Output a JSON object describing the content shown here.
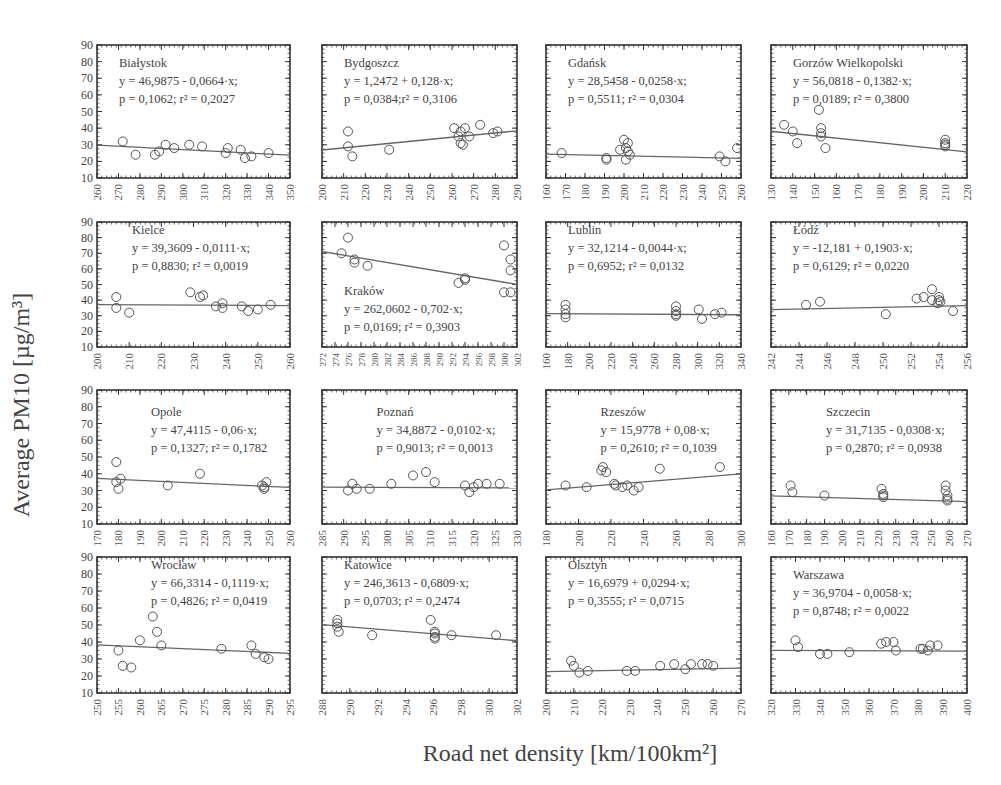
{
  "figure": {
    "y_axis_label": "Average PM10 [µg/m³]",
    "x_axis_label": "Road net density [km/100km²]"
  },
  "chart_data": [
    {
      "type": "scatter",
      "city": "Białystok",
      "equation": "y = 46,9875 - 0,0664·x;",
      "stats": "p = 0,1062; r² = 0,2027",
      "xlim": [
        260,
        350
      ],
      "xticks": [
        260,
        270,
        280,
        290,
        300,
        310,
        320,
        330,
        340,
        350
      ],
      "ylim": [
        10,
        90
      ],
      "yticks": [
        10,
        20,
        30,
        40,
        50,
        60,
        70,
        80,
        90
      ],
      "fit": {
        "intercept": 46.9875,
        "slope": -0.0664
      },
      "x": [
        272,
        278,
        287,
        289,
        292,
        296,
        303,
        309,
        320,
        321,
        327,
        329,
        332,
        340
      ],
      "y": [
        32,
        24,
        24,
        26,
        30,
        28,
        30,
        29,
        25,
        28,
        27,
        22,
        23,
        25
      ],
      "label_pos": "top-left"
    },
    {
      "type": "scatter",
      "city": "Bydgoszcz",
      "equation": "y = 1,2472 + 0,128·x;",
      "stats": "p = 0,0384;r² = 0,3106",
      "xlim": [
        200,
        290
      ],
      "xticks": [
        200,
        210,
        220,
        230,
        240,
        250,
        260,
        270,
        280,
        290
      ],
      "ylim": [
        10,
        90
      ],
      "yticks": [
        10,
        20,
        30,
        40,
        50,
        60,
        70,
        80,
        90
      ],
      "fit": {
        "intercept": 1.2472,
        "slope": 0.128
      },
      "x": [
        212,
        212,
        214,
        231,
        261,
        263,
        264,
        264,
        265,
        266,
        268,
        273,
        279,
        281
      ],
      "y": [
        38,
        29,
        23,
        27,
        40,
        35,
        38,
        31,
        30,
        40,
        35,
        42,
        37,
        38
      ],
      "label_pos": "top-left"
    },
    {
      "type": "scatter",
      "city": "Gdańsk",
      "equation": "y = 28,5458 - 0,0258·x;",
      "stats": "p = 0,5511; r² = 0,0304",
      "xlim": [
        160,
        260
      ],
      "xticks": [
        160,
        170,
        180,
        190,
        200,
        210,
        220,
        230,
        240,
        250,
        260
      ],
      "ylim": [
        10,
        90
      ],
      "yticks": [
        10,
        20,
        30,
        40,
        50,
        60,
        70,
        80,
        90
      ],
      "fit": {
        "intercept": 28.5458,
        "slope": -0.0258
      },
      "x": [
        168,
        191,
        191,
        198,
        200,
        201,
        201,
        202,
        202,
        203,
        249,
        252,
        258
      ],
      "y": [
        25,
        22,
        21,
        27,
        33,
        28,
        21,
        26,
        31,
        24,
        23,
        20,
        28
      ],
      "label_pos": "top-left"
    },
    {
      "type": "scatter",
      "city": "Gorzów Wielkopolski",
      "equation": "y = 56,0818 - 0,1382·x;",
      "stats": "p = 0,0189; r² = 0,3800",
      "xlim": [
        130,
        220
      ],
      "xticks": [
        130,
        140,
        150,
        160,
        170,
        180,
        190,
        200,
        210,
        220
      ],
      "ylim": [
        10,
        90
      ],
      "yticks": [
        10,
        20,
        30,
        40,
        50,
        60,
        70,
        80,
        90
      ],
      "fit": {
        "intercept": 56.0818,
        "slope": -0.1382
      },
      "x": [
        136,
        140,
        142,
        152,
        153,
        153,
        153,
        155,
        210,
        210,
        210,
        210
      ],
      "y": [
        42,
        38,
        31,
        51,
        40,
        37,
        35,
        28,
        33,
        31,
        29,
        30
      ],
      "label_pos": "top-left"
    },
    {
      "type": "scatter",
      "city": "Kielce",
      "equation": "y = 39,3609 - 0,0111·x;",
      "stats": "p = 0,8830; r² = 0,0019",
      "xlim": [
        200,
        260
      ],
      "xticks": [
        200,
        210,
        220,
        230,
        240,
        250,
        260
      ],
      "ylim": [
        10,
        90
      ],
      "yticks": [
        10,
        20,
        30,
        40,
        50,
        60,
        70,
        80,
        90
      ],
      "fit": {
        "intercept": 39.3609,
        "slope": -0.0111
      },
      "x": [
        206,
        206,
        210,
        229,
        232,
        233,
        237,
        239,
        239,
        245,
        247,
        250,
        254
      ],
      "y": [
        42,
        35,
        32,
        45,
        42,
        43,
        36,
        38,
        35,
        36,
        33,
        34,
        37
      ],
      "label_pos": "top-left"
    },
    {
      "type": "scatter",
      "city": "Kraków",
      "equation": "y = 262,0602 - 0,702·x;",
      "stats": "p = 0,0169; r² = 0,3903",
      "xlim": [
        272,
        302
      ],
      "xticks": [
        272,
        274,
        276,
        278,
        280,
        282,
        284,
        286,
        288,
        290,
        292,
        294,
        296,
        298,
        300,
        302
      ],
      "ylim": [
        10,
        90
      ],
      "yticks": [
        10,
        20,
        30,
        40,
        50,
        60,
        70,
        80,
        90
      ],
      "fit": {
        "intercept": 262.0602,
        "slope": -0.702
      },
      "x": [
        275,
        276,
        277,
        277,
        279,
        293,
        294,
        294,
        300,
        300,
        301,
        301,
        301
      ],
      "y": [
        70,
        80,
        66,
        64,
        62,
        51,
        53,
        54,
        75,
        45,
        66,
        59,
        45
      ],
      "label_pos": "bottom-left"
    },
    {
      "type": "scatter",
      "city": "Lublin",
      "equation": "y = 32,1214 - 0,0044·x;",
      "stats": "p = 0,6952; r² = 0,0132",
      "xlim": [
        160,
        340
      ],
      "xticks": [
        160,
        180,
        200,
        220,
        240,
        260,
        280,
        300,
        320,
        340
      ],
      "ylim": [
        10,
        90
      ],
      "yticks": [
        10,
        20,
        30,
        40,
        50,
        60,
        70,
        80,
        90
      ],
      "fit": {
        "intercept": 32.1214,
        "slope": -0.0044
      },
      "x": [
        178,
        178,
        178,
        178,
        280,
        280,
        280,
        280,
        301,
        304,
        316,
        322
      ],
      "y": [
        37,
        34,
        31,
        29,
        36,
        33,
        31,
        30,
        34,
        28,
        31,
        32
      ],
      "label_pos": "top-left"
    },
    {
      "type": "scatter",
      "city": "Łódź",
      "equation": "y = -12,181 + 0,1903·x;",
      "stats": "p = 0,6129; r² = 0,0220",
      "xlim": [
        242,
        256
      ],
      "xticks": [
        242,
        244,
        246,
        248,
        250,
        252,
        254,
        256
      ],
      "ylim": [
        10,
        90
      ],
      "yticks": [
        10,
        20,
        30,
        40,
        50,
        60,
        70,
        80,
        90
      ],
      "fit": {
        "intercept": -12.181,
        "slope": 0.1903
      },
      "x": [
        244.5,
        245.5,
        250.2,
        252.4,
        252.9,
        253.5,
        253.5,
        253.9,
        254.0,
        254.0,
        254.1,
        255.0
      ],
      "y": [
        37,
        39,
        31,
        41,
        42,
        47,
        40,
        38,
        42,
        40,
        39,
        33
      ],
      "label_pos": "top-left"
    },
    {
      "type": "scatter",
      "city": "Opole",
      "equation": "y = 47,4115 - 0,06·x;",
      "stats": "p = 0,1327; r² = 0,1782",
      "xlim": [
        170,
        260
      ],
      "xticks": [
        170,
        180,
        190,
        200,
        210,
        220,
        230,
        240,
        250,
        260
      ],
      "ylim": [
        10,
        90
      ],
      "yticks": [
        10,
        20,
        30,
        40,
        50,
        60,
        70,
        80,
        90
      ],
      "fit": {
        "intercept": 47.4115,
        "slope": -0.06
      },
      "x": [
        179,
        179,
        180,
        181,
        203,
        218,
        247,
        248,
        248,
        249
      ],
      "y": [
        47,
        35,
        31,
        37,
        33,
        40,
        33,
        31,
        32,
        35
      ],
      "label_pos": "top-center"
    },
    {
      "type": "scatter",
      "city": "Poznań",
      "equation": "y = 34,8872 - 0,0102·x;",
      "stats": "p = 0,9013; r² = 0,0013",
      "xlim": [
        285,
        330
      ],
      "xticks": [
        285,
        290,
        295,
        300,
        305,
        310,
        315,
        320,
        325,
        330
      ],
      "ylim": [
        10,
        90
      ],
      "yticks": [
        10,
        20,
        30,
        40,
        50,
        60,
        70,
        80,
        90
      ],
      "fit": {
        "intercept": 34.8872,
        "slope": -0.0102
      },
      "x": [
        291,
        292,
        293,
        296,
        301,
        306,
        309,
        311,
        318,
        319,
        320,
        321,
        323,
        326
      ],
      "y": [
        30,
        34,
        31,
        31,
        34,
        39,
        41,
        35,
        33,
        29,
        32,
        34,
        34,
        34
      ],
      "label_pos": "top-center"
    },
    {
      "type": "scatter",
      "city": "Rzeszów",
      "equation": "y = 15,9778 + 0,08·x;",
      "stats": "p = 0,2610; r² = 0,1039",
      "xlim": [
        180,
        300
      ],
      "xticks": [
        180,
        200,
        220,
        240,
        260,
        280,
        300
      ],
      "ylim": [
        10,
        90
      ],
      "yticks": [
        10,
        20,
        30,
        40,
        50,
        60,
        70,
        80,
        90
      ],
      "fit": {
        "intercept": 15.9778,
        "slope": 0.08
      },
      "x": [
        192,
        205,
        214,
        215,
        217,
        222,
        223,
        227,
        230,
        234,
        237,
        250,
        287
      ],
      "y": [
        33,
        32,
        42,
        44,
        41,
        34,
        33,
        32,
        33,
        30,
        32,
        43,
        44
      ],
      "label_pos": "top-center"
    },
    {
      "type": "scatter",
      "city": "Szczecin",
      "equation": "y = 31,7135 - 0,0308·x;",
      "stats": "p = 0,2870; r² = 0,0938",
      "xlim": [
        160,
        270
      ],
      "xticks": [
        160,
        170,
        180,
        190,
        200,
        210,
        220,
        230,
        240,
        250,
        260,
        270
      ],
      "ylim": [
        10,
        90
      ],
      "yticks": [
        10,
        20,
        30,
        40,
        50,
        60,
        70,
        80,
        90
      ],
      "fit": {
        "intercept": 31.7135,
        "slope": -0.0308
      },
      "x": [
        171,
        172,
        190,
        222,
        223,
        223,
        223,
        258,
        258,
        259,
        259,
        259
      ],
      "y": [
        33,
        29,
        27,
        31,
        28,
        27,
        26,
        33,
        30,
        27,
        25,
        24
      ],
      "label_pos": "top-center"
    },
    {
      "type": "scatter",
      "city": "Wrocław",
      "equation": "y = 66,3314 - 0,1119·x;",
      "stats": "p = 0,4826; r² = 0,0419",
      "xlim": [
        250,
        295
      ],
      "xticks": [
        250,
        255,
        260,
        265,
        270,
        275,
        280,
        285,
        290,
        295
      ],
      "ylim": [
        10,
        90
      ],
      "yticks": [
        10,
        20,
        30,
        40,
        50,
        60,
        70,
        80,
        90
      ],
      "fit": {
        "intercept": 66.3314,
        "slope": -0.1119
      },
      "x": [
        255,
        256,
        258,
        260,
        263,
        264,
        265,
        279,
        286,
        287,
        289,
        290
      ],
      "y": [
        35,
        26,
        25,
        41,
        55,
        46,
        38,
        36,
        38,
        33,
        31,
        30
      ],
      "label_pos": "top-center"
    },
    {
      "type": "scatter",
      "city": "Katowice",
      "equation": "y = 246,3613 - 0,6809·x;",
      "stats": "p = 0,0703; r² = 0,2474",
      "xlim": [
        288,
        302
      ],
      "xticks": [
        288,
        290,
        292,
        294,
        296,
        298,
        300,
        302
      ],
      "ylim": [
        10,
        90
      ],
      "yticks": [
        10,
        20,
        30,
        40,
        50,
        60,
        70,
        80,
        90
      ],
      "fit": {
        "intercept": 246.3613,
        "slope": -0.6809
      },
      "x": [
        289.1,
        289.1,
        289.1,
        289.2,
        291.6,
        295.8,
        296.1,
        296.1,
        296.1,
        296.1,
        297.3,
        300.5
      ],
      "y": [
        53,
        51,
        49,
        46,
        44,
        53,
        46,
        45,
        43,
        42,
        44,
        44
      ],
      "label_pos": "top-left"
    },
    {
      "type": "scatter",
      "city": "Olsztyn",
      "equation": "y = 16,6979 + 0,0294·x;",
      "stats": "p = 0,3555; r² = 0,0715",
      "xlim": [
        200,
        270
      ],
      "xticks": [
        200,
        210,
        220,
        230,
        240,
        250,
        260,
        270
      ],
      "ylim": [
        10,
        90
      ],
      "yticks": [
        10,
        20,
        30,
        40,
        50,
        60,
        70,
        80,
        90
      ],
      "fit": {
        "intercept": 16.6979,
        "slope": 0.0294
      },
      "x": [
        209,
        210,
        212,
        215,
        229,
        232,
        241,
        246,
        250,
        252,
        256,
        258,
        260
      ],
      "y": [
        29,
        26,
        22,
        23,
        23,
        23,
        26,
        27,
        24,
        27,
        27,
        27,
        26
      ],
      "label_pos": "top-left"
    },
    {
      "type": "scatter",
      "city": "Warszawa",
      "equation": "y = 36,9704 - 0,0058·x;",
      "stats": "p = 0,8748; r² = 0,0022",
      "xlim": [
        320,
        400
      ],
      "xticks": [
        320,
        330,
        340,
        350,
        360,
        370,
        380,
        390,
        400
      ],
      "ylim": [
        10,
        90
      ],
      "yticks": [
        10,
        20,
        30,
        40,
        50,
        60,
        70,
        80,
        90
      ],
      "fit": {
        "intercept": 36.9704,
        "slope": -0.0058
      },
      "x": [
        330,
        331,
        340,
        343,
        352,
        365,
        367,
        370,
        371,
        381,
        382,
        384,
        385,
        388
      ],
      "y": [
        41,
        37,
        33,
        33,
        34,
        39,
        40,
        40,
        35,
        36,
        36,
        35,
        38,
        38
      ],
      "label_pos": "top-left"
    }
  ]
}
